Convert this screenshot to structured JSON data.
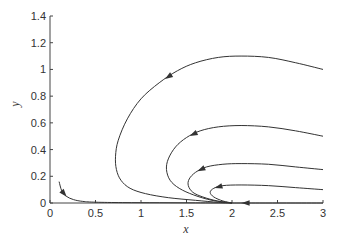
{
  "chart_data": {
    "type": "line",
    "title": "",
    "xlabel": "x",
    "ylabel": "y",
    "xlim": [
      0,
      3
    ],
    "ylim": [
      0,
      1.4
    ],
    "xticks": [
      0,
      0.5,
      1,
      1.5,
      2,
      2.5,
      3
    ],
    "xtick_labels": [
      "0",
      "0.5",
      "1",
      "1.5",
      "2",
      "2.5",
      "3"
    ],
    "yticks": [
      0,
      0.2,
      0.4,
      0.6,
      0.8,
      1,
      1.2,
      1.4
    ],
    "ytick_labels": [
      "0",
      "0.2",
      "0.4",
      "0.6",
      "0.8",
      "1",
      "1.2",
      "1.4"
    ],
    "grid": false,
    "legend": "none",
    "line_color": "#333333",
    "series": [
      {
        "name": "trajectory-1",
        "x": [
          3.0,
          2.7,
          2.4,
          2.1,
          1.85,
          1.6,
          1.4,
          1.2,
          1.0,
          0.85,
          0.75,
          0.72,
          0.73,
          0.78,
          0.88,
          1.05,
          1.3,
          1.6,
          1.85,
          2.0
        ],
        "y": [
          1.0,
          1.05,
          1.09,
          1.1,
          1.09,
          1.05,
          0.99,
          0.9,
          0.78,
          0.63,
          0.47,
          0.35,
          0.25,
          0.17,
          0.11,
          0.07,
          0.04,
          0.02,
          0.005,
          0.0
        ],
        "arrow_index": 6
      },
      {
        "name": "trajectory-2",
        "x": [
          3.0,
          2.7,
          2.4,
          2.1,
          1.85,
          1.65,
          1.5,
          1.38,
          1.3,
          1.28,
          1.32,
          1.42,
          1.58,
          1.78,
          2.0
        ],
        "y": [
          0.5,
          0.54,
          0.57,
          0.58,
          0.57,
          0.54,
          0.49,
          0.42,
          0.33,
          0.25,
          0.17,
          0.11,
          0.06,
          0.02,
          0.0
        ],
        "arrow_index": 5
      },
      {
        "name": "trajectory-3",
        "x": [
          3.0,
          2.7,
          2.4,
          2.1,
          1.9,
          1.72,
          1.6,
          1.53,
          1.52,
          1.57,
          1.68,
          1.84,
          2.0
        ],
        "y": [
          0.25,
          0.27,
          0.29,
          0.295,
          0.29,
          0.27,
          0.23,
          0.18,
          0.13,
          0.08,
          0.045,
          0.015,
          0.0
        ],
        "arrow_index": 5
      },
      {
        "name": "trajectory-4",
        "x": [
          3.0,
          2.7,
          2.4,
          2.1,
          1.9,
          1.8,
          1.76,
          1.8,
          1.9,
          2.0
        ],
        "y": [
          0.1,
          0.115,
          0.13,
          0.135,
          0.13,
          0.11,
          0.08,
          0.045,
          0.015,
          0.0
        ],
        "arrow_index": 4
      },
      {
        "name": "trajectory-5",
        "x": [
          3.0,
          2.6,
          2.3,
          2.0
        ],
        "y": [
          0.0,
          0.0,
          0.0,
          0.0
        ],
        "arrow_index": 2
      },
      {
        "name": "trajectory-6",
        "x": [
          0.1,
          0.13,
          0.18,
          0.26,
          0.36,
          0.5,
          0.8,
          1.2,
          1.6,
          2.0
        ],
        "y": [
          0.16,
          0.09,
          0.05,
          0.025,
          0.012,
          0.006,
          0.003,
          0.002,
          0.001,
          0.0
        ],
        "arrow_index": 1
      }
    ]
  }
}
